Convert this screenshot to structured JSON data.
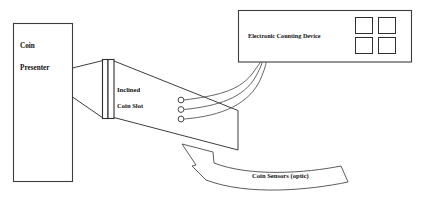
{
  "diagram": {
    "background_color": "#ffffff",
    "line_color": "#3d3d3d",
    "text_color": "#111111",
    "components": {
      "coin_presenter": {
        "label_line1": "Coin",
        "label_line2": "Presenter"
      },
      "inclined_coin_slot": {
        "label_line1": "Inclined",
        "label_line2": "Coin Slot"
      },
      "electronic_counting_device": {
        "label": "Electronic Counting Device",
        "display": {
          "type": "segment-grid",
          "rows": 2,
          "columns": 2,
          "segment_count": 4
        }
      },
      "coin_sensors": {
        "label": "Coin Sensors (optic)",
        "sensor_count": 3,
        "sensor_type": "optic"
      },
      "wiring": {
        "wire_count": 3,
        "description": "curved wires from optic sensors to counting device"
      }
    }
  }
}
